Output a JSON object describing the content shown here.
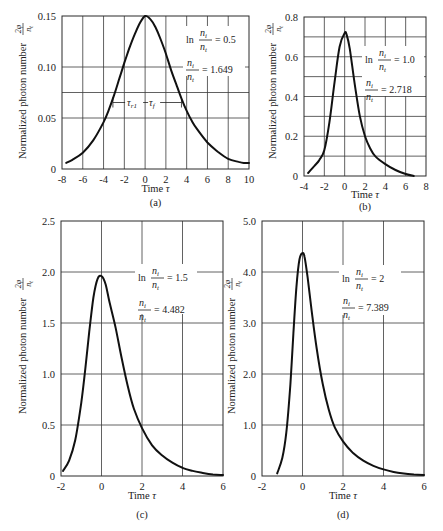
{
  "figure": {
    "ylabel": "Normalized photon number",
    "ylabel_frac_num": "2φ",
    "ylabel_frac_den": "n_t",
    "xlabel": "Time τ"
  },
  "chart_data": [
    {
      "id": "a",
      "type": "line",
      "caption": "(a)",
      "title": "",
      "xlabel": "Time τ",
      "ylabel": "Normalized photon number 2φ/n_t",
      "xlim": [
        -8,
        10
      ],
      "ylim": [
        0,
        0.15
      ],
      "xticks": [
        -8,
        -6,
        -4,
        -2,
        0,
        2,
        4,
        6,
        8,
        10
      ],
      "xtick_labels": [
        "-8",
        "-6",
        "-4",
        "-2",
        "0",
        "2",
        "4",
        "6",
        "8",
        "10"
      ],
      "yticks": [
        0,
        0.05,
        0.1,
        0.15
      ],
      "ytick_labels": [
        "0",
        "0.05",
        "0.10",
        "0.15"
      ],
      "ygrid": [
        0.05,
        0.075,
        0.1
      ],
      "grid": true,
      "annotation": {
        "ln_label": "ln",
        "ln_value": "= 0.5",
        "ratio_value": "= 1.649",
        "num": "n_i",
        "den": "n_t"
      },
      "width_marker": {
        "y": 0.075,
        "x_left": -3.1,
        "x_right": 3.5,
        "label_rise": "τ_r1",
        "label_fall": "τ_f"
      },
      "x": [
        -7.6,
        -7,
        -6,
        -5,
        -4,
        -3.5,
        -3,
        -2.5,
        -2,
        -1.5,
        -1,
        -0.5,
        0,
        0.5,
        1,
        1.5,
        2,
        2.5,
        3,
        3.5,
        4,
        4.5,
        5,
        6,
        7,
        8,
        9,
        9.5,
        10
      ],
      "y": [
        0.006,
        0.009,
        0.016,
        0.028,
        0.046,
        0.058,
        0.072,
        0.088,
        0.104,
        0.119,
        0.132,
        0.143,
        0.15,
        0.147,
        0.139,
        0.127,
        0.113,
        0.097,
        0.083,
        0.069,
        0.057,
        0.047,
        0.039,
        0.026,
        0.017,
        0.01,
        0.007,
        0.006,
        0.006
      ]
    },
    {
      "id": "b",
      "type": "line",
      "caption": "(b)",
      "title": "",
      "xlabel": "Time τ",
      "ylabel": "Normalized photon number 2φ/n_t",
      "xlim": [
        -4,
        8
      ],
      "ylim": [
        0,
        0.8
      ],
      "xticks": [
        -4,
        -2,
        0,
        2,
        4,
        6,
        8
      ],
      "xtick_labels": [
        "-4",
        "-2",
        "0",
        "2",
        "4",
        "6",
        "8"
      ],
      "yticks": [
        0,
        0.2,
        0.4,
        0.6,
        0.8
      ],
      "ytick_labels": [
        "0",
        "0.2",
        "0.4",
        "0.6",
        "0.8"
      ],
      "ygrid": [
        0.1,
        0.2,
        0.3,
        0.4,
        0.5,
        0.6,
        0.7
      ],
      "grid": true,
      "annotation": {
        "ln_label": "ln",
        "ln_value": "= 1.0",
        "ratio_value": "= 2.718",
        "num": "n_i",
        "den": "n_t"
      },
      "x": [
        -3.6,
        -3,
        -2.5,
        -2,
        -1.5,
        -1,
        -0.5,
        0,
        0.2,
        0.5,
        1,
        1.5,
        2,
        2.5,
        3,
        4,
        5,
        6,
        6.8
      ],
      "y": [
        0.015,
        0.05,
        0.08,
        0.13,
        0.27,
        0.47,
        0.65,
        0.72,
        0.71,
        0.64,
        0.46,
        0.3,
        0.2,
        0.14,
        0.1,
        0.06,
        0.03,
        0.01,
        0.0
      ]
    },
    {
      "id": "c",
      "type": "line",
      "caption": "(c)",
      "title": "",
      "xlabel": "Time τ",
      "ylabel": "Normalized photon number 2φ/n_t",
      "xlim": [
        -2,
        6
      ],
      "ylim": [
        0,
        2.5
      ],
      "xticks": [
        -2,
        0,
        2,
        4,
        6
      ],
      "xtick_labels": [
        "-2",
        "0",
        "2",
        "4",
        "6"
      ],
      "yticks": [
        0,
        0.5,
        1.0,
        1.5,
        2.0,
        2.5
      ],
      "ytick_labels": [
        "0",
        "0.5",
        "1.0",
        "1.5",
        "2.0",
        "2.5"
      ],
      "ygrid": [
        0.5,
        1.0,
        1.5,
        2.0
      ],
      "grid": true,
      "annotation": {
        "ln_label": "ln",
        "ln_value": "= 1.5",
        "ratio_value": "= 4.482",
        "num": "n_i",
        "den": "n_t"
      },
      "x": [
        -1.9,
        -1.6,
        -1.3,
        -1.0,
        -0.8,
        -0.6,
        -0.4,
        -0.2,
        0,
        0.2,
        0.4,
        0.7,
        1.0,
        1.3,
        1.6,
        2.0,
        2.5,
        3,
        3.5,
        4,
        4.5,
        5,
        5.5,
        6
      ],
      "y": [
        0.05,
        0.15,
        0.35,
        0.72,
        1.05,
        1.42,
        1.75,
        1.93,
        1.96,
        1.88,
        1.7,
        1.45,
        1.15,
        0.88,
        0.66,
        0.47,
        0.3,
        0.2,
        0.13,
        0.08,
        0.05,
        0.03,
        0.015,
        0.01
      ]
    },
    {
      "id": "d",
      "type": "line",
      "caption": "(d)",
      "title": "",
      "xlabel": "Time τ",
      "ylabel": "Normalized photon number 2φ/n_t",
      "xlim": [
        -2,
        6
      ],
      "ylim": [
        0,
        5.0
      ],
      "xticks": [
        -2,
        0,
        2,
        4,
        6
      ],
      "xtick_labels": [
        "-2",
        "0",
        "2",
        "4",
        "6"
      ],
      "yticks": [
        0,
        1.0,
        2.0,
        3.0,
        4.0,
        5.0
      ],
      "ytick_labels": [
        "0",
        "1.0",
        "2.0",
        "3.0",
        "4.0",
        "5.0"
      ],
      "ygrid": [
        1.0,
        2.0,
        3.0,
        4.0
      ],
      "grid": true,
      "annotation": {
        "ln_label": "ln",
        "ln_value": "= 2",
        "ratio_value": "= 7.389",
        "num": "n_i",
        "den": "n_t"
      },
      "x": [
        -1.25,
        -1.0,
        -0.8,
        -0.6,
        -0.45,
        -0.3,
        -0.15,
        0,
        0.1,
        0.25,
        0.45,
        0.7,
        1.0,
        1.3,
        1.6,
        2.0,
        2.5,
        3,
        3.5,
        4,
        4.5,
        5,
        5.5,
        6
      ],
      "y": [
        0.05,
        0.35,
        0.85,
        1.8,
        2.8,
        3.7,
        4.25,
        4.37,
        4.3,
        3.9,
        3.25,
        2.5,
        1.8,
        1.3,
        0.95,
        0.68,
        0.45,
        0.3,
        0.2,
        0.13,
        0.08,
        0.05,
        0.03,
        0.02
      ]
    }
  ]
}
